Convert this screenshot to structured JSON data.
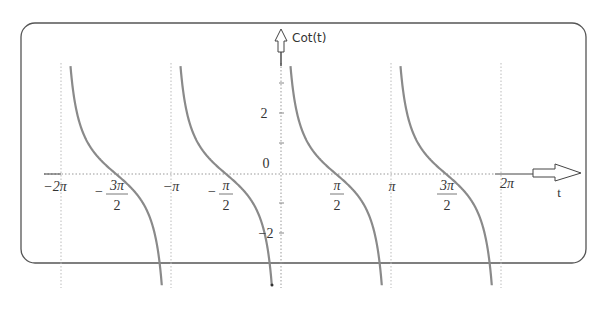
{
  "chart_data": {
    "type": "line",
    "title": "",
    "function": "Cot(t)",
    "xlabel": "t",
    "ylabel": "Cot(t)",
    "xlim": [
      -6.283,
      6.9
    ],
    "ylim": [
      -3.8,
      3.7
    ],
    "grid": {
      "vertical_at": [
        "-2π",
        "-π",
        "0",
        "π",
        "2π"
      ],
      "style": "dotted"
    },
    "x_tick_labels": [
      "-2π",
      "-3π/2",
      "-π",
      "-π/2",
      "π/2",
      "π",
      "3π/2",
      "2π"
    ],
    "y_tick_labels": [
      "2",
      "0",
      "-2"
    ],
    "series": [
      {
        "name": "Cot(t)",
        "domain": "(-2π, 2π)",
        "asymptotes": [
          "-2π",
          "-π",
          "0",
          "π",
          "2π"
        ],
        "zeros": [
          "-3π/2",
          "-π/2",
          "π/2",
          "3π/2"
        ]
      }
    ],
    "legend": "none"
  },
  "labels": {
    "y_axis": "Cot(t)",
    "x_axis": "t",
    "ticks_x": {
      "neg2pi": "−2π",
      "neg3pi2_num": "3π",
      "neg3pi2_den": "2",
      "negpi": "−π",
      "negpi2_num": "π",
      "negpi2_den": "2",
      "pi2_num": "π",
      "pi2_den": "2",
      "pi": "π",
      "threepi2_num": "3π",
      "threepi2_den": "2",
      "twopi": "2π"
    },
    "ticks_y": {
      "two": "2",
      "zero": "0",
      "neg2": "−2"
    },
    "minus": "−"
  },
  "colors": {
    "curve": "#8a8a8a",
    "axis": "#444444",
    "grid": "#bbbbbb",
    "frame": "#555555"
  }
}
